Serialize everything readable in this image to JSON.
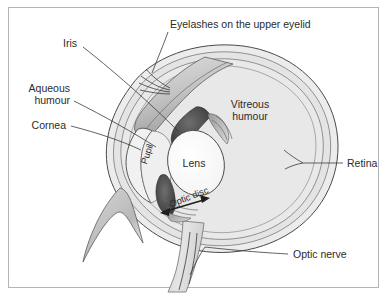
{
  "figure": {
    "title_label": "Eyelashes on the upper eyelid",
    "background_color": "#ffffff",
    "frame_color": "#b4b4b4",
    "ink_color": "#2b2b2b"
  },
  "labels": {
    "eyelashes": "Eyelashes on the upper eyelid",
    "iris": "Iris",
    "aqueous_line1": "Aqueous",
    "aqueous_line2": "humour",
    "cornea": "Cornea",
    "pupil": "Pupil",
    "lens": "Lens",
    "vitreous_line1": "Vitreous",
    "vitreous_line2": "humour",
    "retina": "Retina",
    "optic_disc": "Optic disc",
    "optic_nerve": "Optic nerve"
  },
  "colors": {
    "sclera_fill": "#ececec",
    "choroid_fill": "#dcdcdc",
    "vitreous_fill": "#e8e8e8",
    "aqueous_fill": "#efefef",
    "lens_fill": "#fbfbfb",
    "iris_fill": "#5a5a5a",
    "iris_dark": "#3f3f3f",
    "eyelid_fill": "#c9c9c9",
    "nerve_fill": "#d9d9d9",
    "outline": "#4a4a4a"
  }
}
